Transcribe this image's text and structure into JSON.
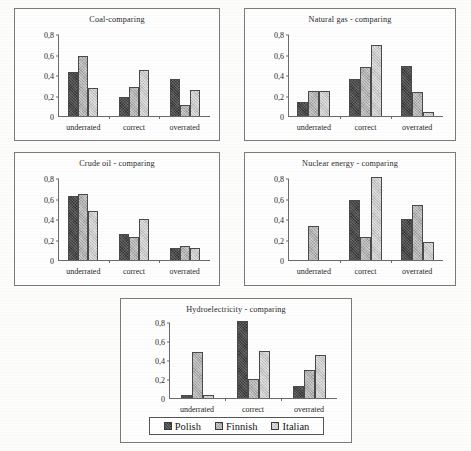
{
  "chart_data": [
    {
      "type": "bar",
      "title": "Coal-comparing",
      "xlabel": "",
      "ylabel": "",
      "ylim": [
        0,
        0.8
      ],
      "yticks": [
        "0",
        "0,2",
        "0,4",
        "0,6",
        "0,8"
      ],
      "ytick_values": [
        0,
        0.2,
        0.4,
        0.6,
        0.8
      ],
      "grid": false,
      "legend_position": "none",
      "categories": [
        "underrated",
        "correct",
        "overrated"
      ],
      "series": [
        {
          "name": "Polish",
          "values": [
            0.43,
            0.19,
            0.36
          ]
        },
        {
          "name": "Finnish",
          "values": [
            0.59,
            0.28,
            0.11
          ]
        },
        {
          "name": "Italian",
          "values": [
            0.27,
            0.45,
            0.25
          ]
        }
      ]
    },
    {
      "type": "bar",
      "title": "Natural gas - comparing",
      "xlabel": "",
      "ylabel": "",
      "ylim": [
        0,
        0.8
      ],
      "yticks": [
        "0",
        "0,2",
        "0,4",
        "0,6",
        "0,8"
      ],
      "ytick_values": [
        0,
        0.2,
        0.4,
        0.6,
        0.8
      ],
      "grid": false,
      "legend_position": "none",
      "categories": [
        "underrated",
        "correct",
        "overrated"
      ],
      "series": [
        {
          "name": "Polish",
          "values": [
            0.14,
            0.36,
            0.49
          ]
        },
        {
          "name": "Finnish",
          "values": [
            0.24,
            0.48,
            0.23
          ]
        },
        {
          "name": "Italian",
          "values": [
            0.24,
            0.69,
            0.04
          ]
        }
      ]
    },
    {
      "type": "bar",
      "title": "Crude oil - comparing",
      "xlabel": "",
      "ylabel": "",
      "ylim": [
        0,
        0.8
      ],
      "yticks": [
        "0",
        "0,2",
        "0,4",
        "0,6",
        "0,8"
      ],
      "ytick_values": [
        0,
        0.2,
        0.4,
        0.6,
        0.8
      ],
      "grid": false,
      "legend_position": "none",
      "categories": [
        "underrated",
        "correct",
        "overrated"
      ],
      "series": [
        {
          "name": "Polish",
          "values": [
            0.62,
            0.25,
            0.12
          ]
        },
        {
          "name": "Finnish",
          "values": [
            0.64,
            0.22,
            0.14
          ]
        },
        {
          "name": "Italian",
          "values": [
            0.48,
            0.4,
            0.12
          ]
        }
      ]
    },
    {
      "type": "bar",
      "title": "Nuclear energy - comparing",
      "xlabel": "",
      "ylabel": "",
      "ylim": [
        0,
        0.8
      ],
      "yticks": [
        "0",
        "0,2",
        "0,4",
        "0,6",
        "0,8"
      ],
      "ytick_values": [
        0,
        0.2,
        0.4,
        0.6,
        0.8
      ],
      "grid": false,
      "legend_position": "none",
      "categories": [
        "underrated",
        "correct",
        "overrated"
      ],
      "series": [
        {
          "name": "Polish",
          "values": [
            0,
            0.59,
            0.4
          ]
        },
        {
          "name": "Finnish",
          "values": [
            0.33,
            0.22,
            0.54
          ]
        },
        {
          "name": "Italian",
          "values": [
            0,
            0.81,
            0.18
          ]
        }
      ]
    },
    {
      "type": "bar",
      "title": "Hydroelectricity - comparing",
      "xlabel": "",
      "ylabel": "",
      "ylim": [
        0,
        0.8
      ],
      "yticks": [
        "0",
        "0,2",
        "0,4",
        "0,6",
        "0,8"
      ],
      "ytick_values": [
        0,
        0.2,
        0.4,
        0.6,
        0.8
      ],
      "grid": false,
      "legend_position": "bottom",
      "categories": [
        "underrated",
        "correct",
        "overrated"
      ],
      "series": [
        {
          "name": "Polish",
          "values": [
            0.03,
            0.81,
            0.13
          ]
        },
        {
          "name": "Finnish",
          "values": [
            0.48,
            0.2,
            0.3
          ]
        },
        {
          "name": "Italian",
          "values": [
            0.03,
            0.5,
            0.45
          ]
        }
      ]
    }
  ],
  "legend": {
    "items": [
      {
        "label": "Polish",
        "color": "#3f3f3f"
      },
      {
        "label": "Finnish",
        "color": "#b2b2b2"
      },
      {
        "label": "Italian",
        "color": "#c9c9c9"
      }
    ]
  }
}
